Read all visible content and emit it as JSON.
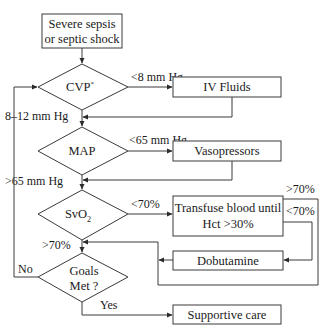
{
  "diagram": {
    "type": "flowchart",
    "start": {
      "line1": "Severe sepsis",
      "line2": "or septic shock"
    },
    "decisions": {
      "cvp": {
        "label": "CVP",
        "superscript": "*"
      },
      "map": {
        "label": "MAP"
      },
      "svo2": {
        "label": "SvO",
        "subscript": "2"
      },
      "goals": {
        "line1": "Goals",
        "line2": "Met ?"
      }
    },
    "actions": {
      "iv_fluids": "IV Fluids",
      "vasopressors": "Vasopressors",
      "transfuse": {
        "line1": "Transfuse blood until",
        "line2": "Hct >30%"
      },
      "dobutamine": "Dobutamine",
      "supportive": "Supportive care"
    },
    "edge_labels": {
      "cvp_low": "<8 mm Hg",
      "cvp_ok": "8–12 mm Hg",
      "map_low": "<65 mm Hg",
      "map_ok": ">65 mm Hg",
      "svo2_low": "<70%",
      "transfuse_high": ">70%",
      "transfuse_low": "<70%",
      "svo2_ok": ">70%",
      "goals_no": "No",
      "goals_yes": "Yes"
    },
    "colors": {
      "stroke": "#3a3a3a",
      "text": "#1a1a1a",
      "background": "#ffffff"
    }
  }
}
